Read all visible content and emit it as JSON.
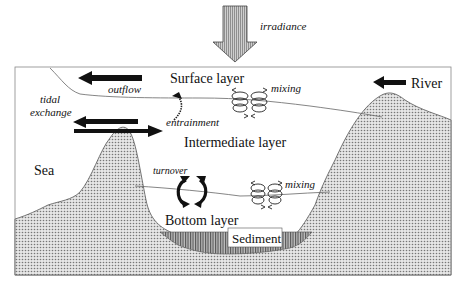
{
  "diagram": {
    "labels": {
      "irradiance": "irradiance",
      "surface_layer": "Surface layer",
      "intermediate_layer": "Intermediate layer",
      "bottom_layer": "Bottom layer",
      "sediment": "Sediment",
      "river": "River",
      "sea": "Sea",
      "outflow": "outflow",
      "tidal_exchange_line1": "tidal",
      "tidal_exchange_line2": "exchange",
      "entrainment": "entrainment",
      "mixing_upper": "mixing",
      "mixing_lower": "mixing",
      "turnover": "turnover"
    },
    "icons": {
      "irradiance_arrow": "down-arrow-icon",
      "river_arrow": "left-arrow-icon",
      "outflow_arrow": "left-arrow-icon",
      "tidal_in_arrow": "left-arrow-icon",
      "tidal_out_arrow": "right-arrow-icon",
      "entrainment_arrow": "curved-arrow-icon",
      "mixing_eddies": "eddy-icon",
      "turnover_arrows": "circular-arrows-icon"
    },
    "colors": {
      "land_fill": "#d9d9d9",
      "sediment_fill": "#8c8c8c",
      "arrow_fill": "#111111",
      "irradiance_fill": "#b0b0b0",
      "line": "#555555"
    }
  }
}
